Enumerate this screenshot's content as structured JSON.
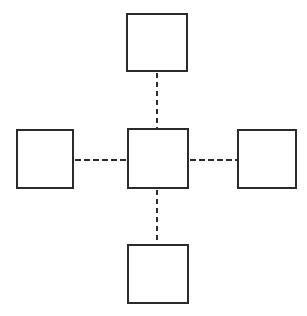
{
  "diagram": {
    "type": "node-link-diagram",
    "canvas": {
      "width": 307,
      "height": 316,
      "background_color": "#ffffff"
    },
    "style": {
      "node_fill_color": "#ffffff",
      "node_border_color": "#2b2b2b",
      "node_border_width_px": 2,
      "connector_color": "#2b2b2b",
      "connector_width_px": 2,
      "connector_style": "dashed",
      "connector_dash_length_px": 6,
      "connector_gap_length_px": 3
    },
    "nodes": [
      {
        "id": "center",
        "label": "",
        "shape": "square",
        "x": 127,
        "y": 128,
        "width": 62,
        "height": 61
      },
      {
        "id": "top",
        "label": "",
        "shape": "square",
        "x": 126,
        "y": 13,
        "width": 62,
        "height": 59
      },
      {
        "id": "right",
        "label": "",
        "shape": "square",
        "x": 237,
        "y": 129,
        "width": 60,
        "height": 60
      },
      {
        "id": "bottom",
        "label": "",
        "shape": "square",
        "x": 127,
        "y": 244,
        "width": 62,
        "height": 60
      },
      {
        "id": "left",
        "label": "",
        "shape": "square",
        "x": 16,
        "y": 129,
        "width": 58,
        "height": 60
      }
    ],
    "connectors": [
      {
        "id": "center-top",
        "label": "",
        "from": "center",
        "to": "top",
        "orientation": "vertical",
        "style": "dashed"
      },
      {
        "id": "center-bottom",
        "label": "",
        "from": "center",
        "to": "bottom",
        "orientation": "vertical",
        "style": "dashed"
      },
      {
        "id": "center-left",
        "label": "",
        "from": "center",
        "to": "left",
        "orientation": "horizontal",
        "style": "dashed"
      },
      {
        "id": "center-right",
        "label": "",
        "from": "center",
        "to": "right",
        "orientation": "horizontal",
        "style": "dashed"
      }
    ]
  }
}
